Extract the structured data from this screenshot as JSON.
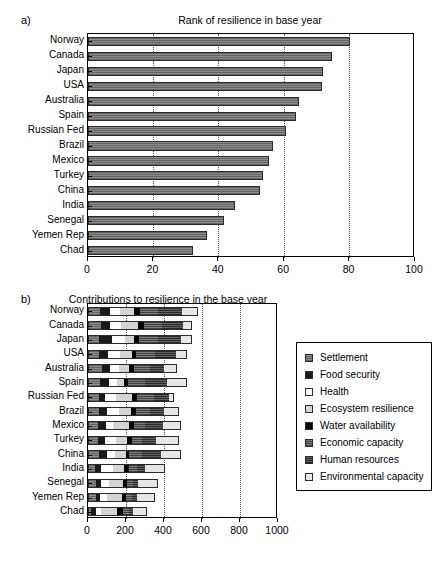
{
  "figure": {
    "background": "#ffffff",
    "bar_fill": "#8d8d8d",
    "bar_edge": "#2b2b2b",
    "grid_color": "#555555"
  },
  "panel_a": {
    "letter": "a)",
    "title": "Rank of resilience in base year",
    "chart_data": {
      "type": "bar",
      "orientation": "horizontal",
      "title": "Rank of resilience in base year",
      "xlabel": "",
      "ylabel": "",
      "xlim": [
        0,
        100
      ],
      "xticks": [
        0,
        20,
        40,
        60,
        80,
        100
      ],
      "grid": true,
      "grid_axis": "x",
      "legend": false,
      "categories": [
        "Norway",
        "Canada",
        "Japan",
        "USA",
        "Australia",
        "Spain",
        "Russian Fed",
        "Brazil",
        "Mexico",
        "Turkey",
        "China",
        "India",
        "Senegal",
        "Yemen Rep",
        "Chad"
      ],
      "values": [
        80.0,
        74.5,
        72.0,
        71.5,
        64.5,
        63.5,
        60.5,
        56.5,
        55.5,
        53.5,
        52.5,
        45.0,
        41.5,
        36.5,
        32.0
      ]
    }
  },
  "panel_b": {
    "letter": "b)",
    "title": "Contributions to resilience in the base year",
    "chart_data": {
      "type": "bar",
      "subtype": "stacked",
      "orientation": "horizontal",
      "title": "Contributions to resilience in the base year",
      "xlabel": "",
      "ylabel": "",
      "xlim": [
        0,
        1000
      ],
      "xticks": [
        0,
        200,
        400,
        600,
        800,
        1000
      ],
      "grid": true,
      "grid_axis": "x",
      "legend": true,
      "legend_position": "right",
      "categories": [
        "Norway",
        "Canada",
        "Japan",
        "USA",
        "Australia",
        "Spain",
        "Russian Fed",
        "Brazil",
        "Mexico",
        "Turkey",
        "China",
        "India",
        "Senegal",
        "Yemen Rep",
        "Chad"
      ],
      "series": [
        {
          "name": "Settlement",
          "key": "settlement",
          "fill": "f-settlement",
          "color": "#8d8d8d",
          "values": [
            62,
            70,
            60,
            58,
            74,
            62,
            58,
            56,
            54,
            50,
            60,
            36,
            42,
            40,
            18
          ]
        },
        {
          "name": "Food security",
          "key": "food",
          "fill": "f-food",
          "color": "#1a1a1a",
          "values": [
            56,
            48,
            64,
            48,
            44,
            46,
            30,
            44,
            42,
            42,
            38,
            34,
            24,
            22,
            26
          ]
        },
        {
          "name": "Health",
          "key": "health",
          "fill": "f-health",
          "color": "#ffffff",
          "values": [
            52,
            56,
            70,
            62,
            44,
            44,
            58,
            62,
            38,
            56,
            44,
            64,
            42,
            40,
            22
          ]
        },
        {
          "name": "Ecosystem resilience",
          "key": "ecosys",
          "fill": "f-ecosys",
          "color": "#d4d4d4",
          "values": [
            72,
            88,
            50,
            62,
            56,
            36,
            86,
            62,
            80,
            56,
            58,
            58,
            76,
            78,
            86
          ]
        },
        {
          "name": "Water availability",
          "key": "water",
          "fill": "f-water",
          "color": "#050505",
          "values": [
            30,
            32,
            22,
            22,
            26,
            20,
            28,
            30,
            26,
            26,
            14,
            24,
            22,
            22,
            30
          ]
        },
        {
          "name": "Economic capacity",
          "key": "econ",
          "fill": "f-econ",
          "color": "#6f6f6f",
          "values": [
            98,
            94,
            104,
            100,
            82,
            94,
            88,
            70,
            62,
            56,
            72,
            40,
            32,
            32,
            34
          ]
        },
        {
          "name": "Human resources",
          "key": "human",
          "fill": "f-human",
          "color": "#4a4a4a",
          "values": [
            124,
            110,
            120,
            112,
            76,
            116,
            80,
            76,
            92,
            72,
            98,
            46,
            26,
            24,
            20
          ]
        },
        {
          "name": "Environmental capacity",
          "key": "envcap",
          "fill": "f-envcap",
          "color": "#e6e6e6",
          "values": [
            86,
            52,
            56,
            56,
            66,
            102,
            26,
            80,
            96,
            122,
            106,
            102,
            102,
            96,
            76
          ]
        }
      ],
      "totals": [
        580,
        550,
        546,
        520,
        468,
        520,
        454,
        480,
        490,
        480,
        490,
        404,
        366,
        354,
        312
      ]
    },
    "legend": {
      "items": [
        {
          "label": "Settlement",
          "fill": "f-settlement"
        },
        {
          "label": "Food security",
          "fill": "f-food"
        },
        {
          "label": "Health",
          "fill": "f-health"
        },
        {
          "label": "Ecosystem resilience",
          "fill": "f-ecosys"
        },
        {
          "label": "Water availability",
          "fill": "f-water"
        },
        {
          "label": "Economic capacity",
          "fill": "f-econ"
        },
        {
          "label": "Human resources",
          "fill": "f-human"
        },
        {
          "label": "Environmental capacity",
          "fill": "f-envcap"
        }
      ]
    }
  }
}
